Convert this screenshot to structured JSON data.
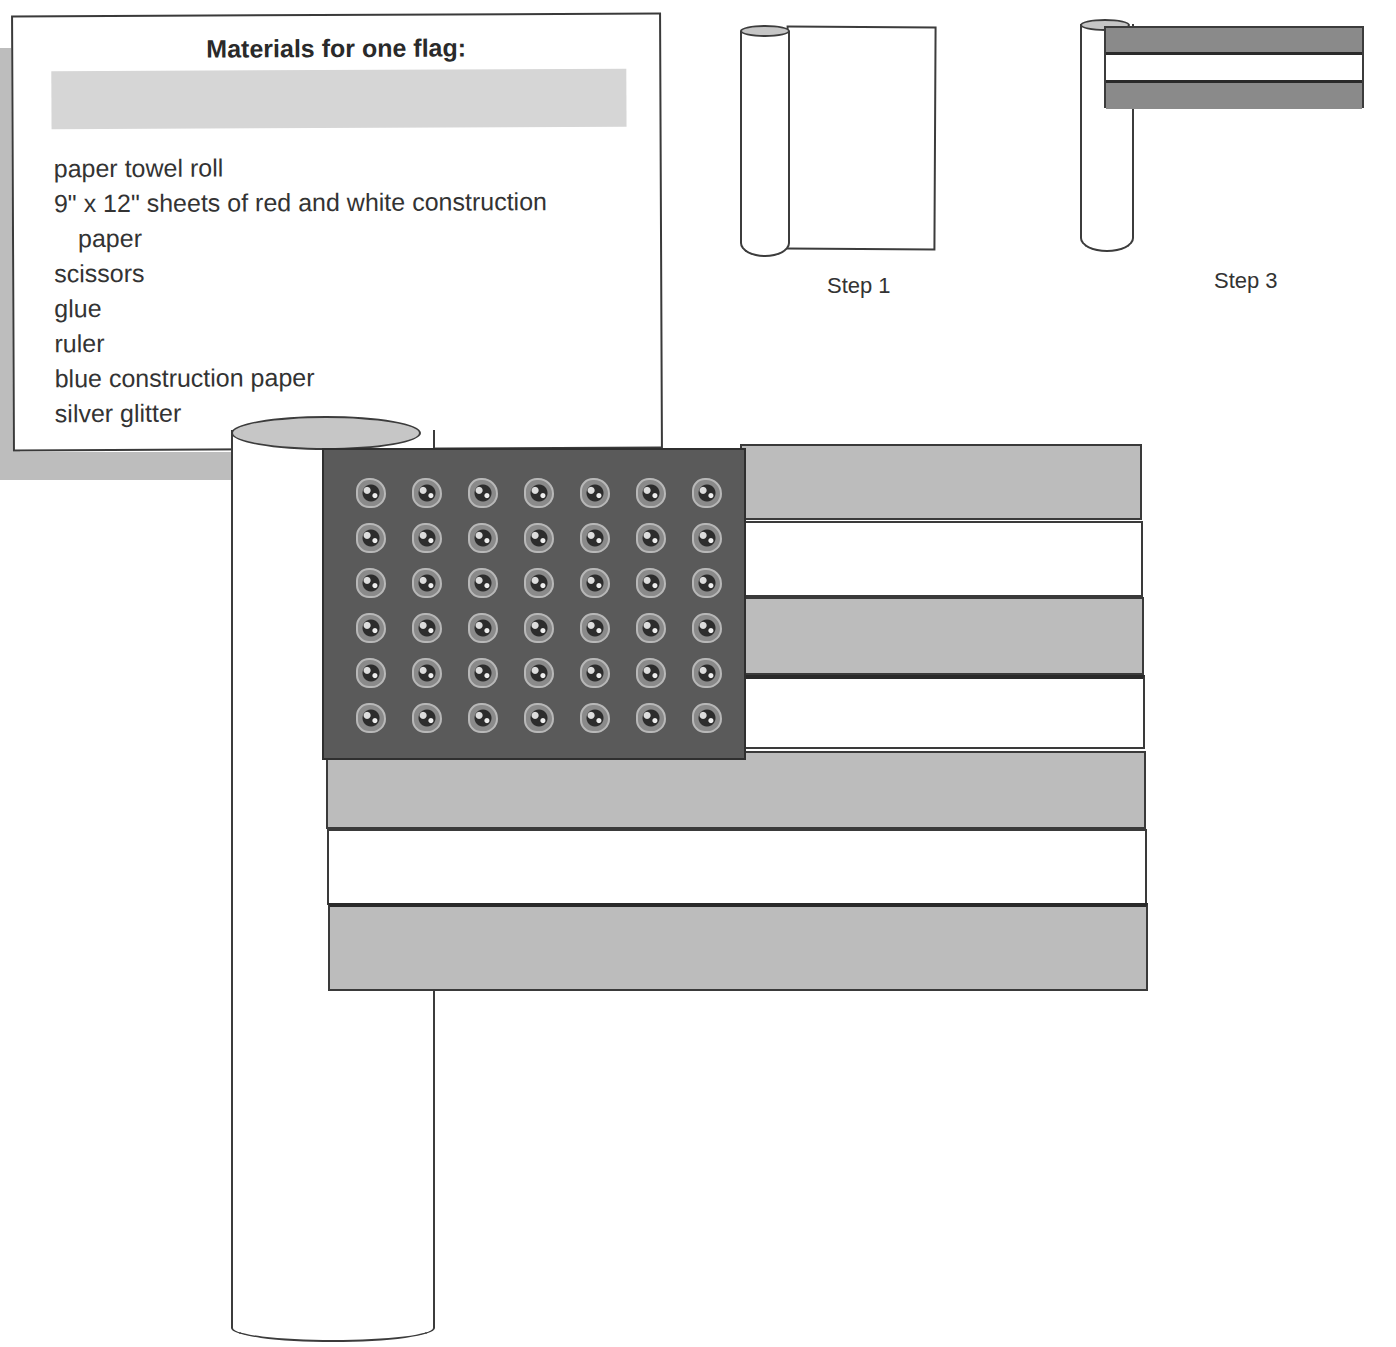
{
  "materials_card": {
    "title": "Materials for one flag:",
    "items": [
      {
        "text": "paper towel roll",
        "indent": false
      },
      {
        "text": "9\" x 12\" sheets of red and white construction",
        "indent": false
      },
      {
        "text": "paper",
        "indent": true
      },
      {
        "text": "scissors",
        "indent": false
      },
      {
        "text": "glue",
        "indent": false
      },
      {
        "text": "ruler",
        "indent": false
      },
      {
        "text": "blue construction paper",
        "indent": false
      },
      {
        "text": "silver glitter",
        "indent": false
      }
    ]
  },
  "steps": [
    {
      "label": "Step 1",
      "illustration": "paper-towel-roll-with-white-sheet"
    },
    {
      "label": "Step 3",
      "illustration": "paper-towel-roll-with-red-white-red-stripes"
    }
  ],
  "main_flag": {
    "illustration": "finished-paper-towel-roll-flag",
    "canton": {
      "rows": 6,
      "columns": 7,
      "star_icon": "glitter-star-icon",
      "star_count": 42
    },
    "stripes": [
      "red",
      "white",
      "red",
      "white",
      "red",
      "white",
      "red"
    ]
  },
  "colors": {
    "red_stripe": "#bcbcbc",
    "white_stripe": "#ffffff",
    "blue_canton": "#5a5a5a",
    "outline": "#3a3a3a",
    "tube_top": "#c6c6c6",
    "card_bar": "#d6d6d6",
    "card_shadow": "#bdbdbd"
  }
}
